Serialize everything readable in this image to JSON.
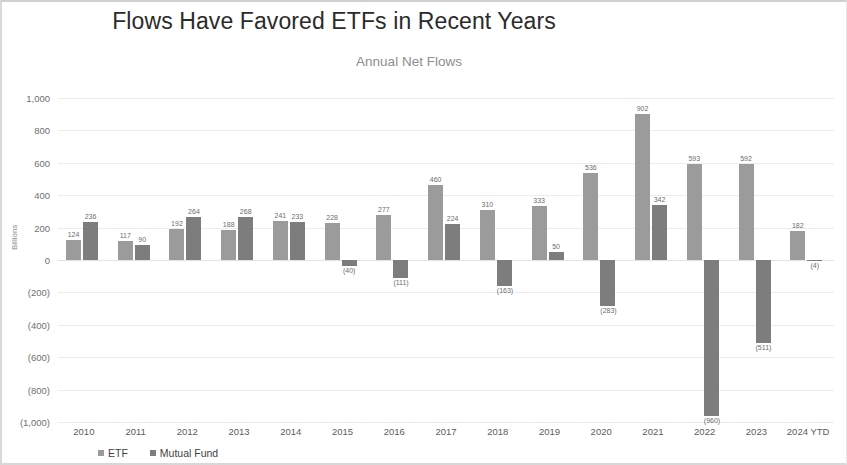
{
  "chart_data": {
    "type": "bar",
    "title": "Flows Have Favored ETFs in Recent Years",
    "subtitle": "Annual Net Flows",
    "xlabel": "",
    "ylabel": "Billions",
    "ylim": [
      -1000,
      1000
    ],
    "ytick_labels": [
      "1,000",
      "800",
      "600",
      "400",
      "200",
      "0",
      "(200)",
      "(400)",
      "(600)",
      "(800)",
      "(1,000)"
    ],
    "ytick_values": [
      1000,
      800,
      600,
      400,
      200,
      0,
      -200,
      -400,
      -600,
      -800,
      -1000
    ],
    "grid": true,
    "legend_position": "bottom-left",
    "categories": [
      "2010",
      "2011",
      "2012",
      "2013",
      "2014",
      "2015",
      "2016",
      "2017",
      "2018",
      "2019",
      "2020",
      "2021",
      "2022",
      "2023",
      "2024 YTD"
    ],
    "series": [
      {
        "name": "ETF",
        "color": "#9b9b9b",
        "values": [
          124,
          117,
          192,
          188,
          241,
          228,
          277,
          460,
          310,
          333,
          536,
          902,
          593,
          592,
          182
        ],
        "labels": [
          "124",
          "117",
          "192",
          "188",
          "241",
          "228",
          "277",
          "460",
          "310",
          "333",
          "536",
          "902",
          "593",
          "592",
          "182"
        ]
      },
      {
        "name": "Mutual Fund",
        "color": "#7d7d7d",
        "values": [
          236,
          90,
          264,
          268,
          233,
          -40,
          -111,
          224,
          -163,
          50,
          -283,
          342,
          -960,
          -511,
          -4
        ],
        "labels": [
          "236",
          "90",
          "264",
          "268",
          "233",
          "(40)",
          "(111)",
          "224",
          "(163)",
          "50",
          "(283)",
          "342",
          "(960)",
          "(511)",
          "(4)"
        ]
      }
    ]
  },
  "legend": {
    "items": [
      {
        "label": "ETF"
      },
      {
        "label": "Mutual Fund"
      }
    ]
  }
}
